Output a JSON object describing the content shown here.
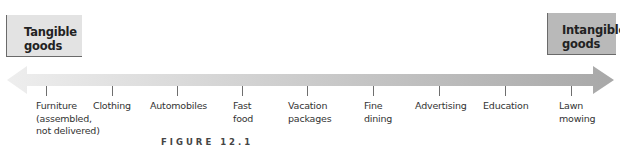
{
  "diagram": {
    "type": "continuum",
    "left_end": {
      "label": "Tangible\ngoods",
      "line1": "Tangible",
      "line2": "goods",
      "fill": "#e3e3e3"
    },
    "right_end": {
      "label": "Intangible\ngoods",
      "line1": "Intangible",
      "line2": "goods",
      "fill": "#b9b9b9"
    },
    "arrow": {
      "gradient_start": "#eeeeee",
      "gradient_end": "#a8a8a8",
      "bidirectional": true
    },
    "items": [
      {
        "label": "Furniture\n(assembled,\nnot delivered)",
        "tick_x": 46,
        "label_x": 36
      },
      {
        "label": "Clothing",
        "tick_x": 112,
        "label_x": 93
      },
      {
        "label": "Automobiles",
        "tick_x": 177,
        "label_x": 150
      },
      {
        "label": "Fast\nfood",
        "tick_x": 242,
        "label_x": 233
      },
      {
        "label": "Vacation\npackages",
        "tick_x": 307,
        "label_x": 288
      },
      {
        "label": "Fine\ndining",
        "tick_x": 373,
        "label_x": 364
      },
      {
        "label": "Advertising",
        "tick_x": 439,
        "label_x": 415
      },
      {
        "label": "Education",
        "tick_x": 505,
        "label_x": 483
      },
      {
        "label": "Lawn\nmowing",
        "tick_x": 571,
        "label_x": 559
      }
    ]
  },
  "caption": "FIGURE 12.1"
}
